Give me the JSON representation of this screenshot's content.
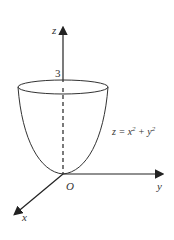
{
  "diagram": {
    "axes": {
      "z": "z",
      "y": "y",
      "x": "x",
      "origin": "O"
    },
    "height_label": "3",
    "equation": {
      "lhs": "z = x",
      "exp1": "2",
      "mid": " + y",
      "exp2": "2"
    },
    "stroke_color": "#333333"
  }
}
